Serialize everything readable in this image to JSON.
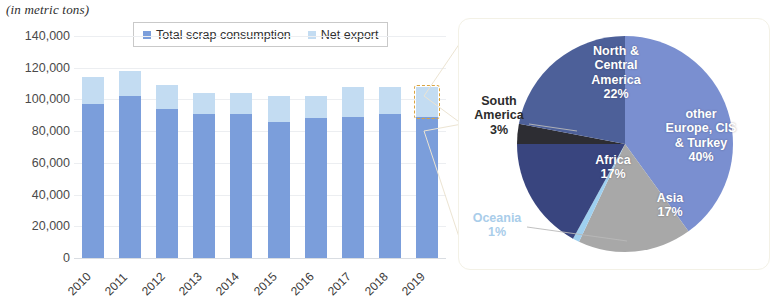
{
  "title_note": "(in metric tons)",
  "legend": {
    "items": [
      {
        "label": "Total scrap consumption",
        "color": "#7b9edb",
        "icon": "legend-square-icon"
      },
      {
        "label": "Net export",
        "color": "#c3dcf2",
        "icon": "legend-square-icon"
      }
    ]
  },
  "chart_data": [
    {
      "type": "bar",
      "title": "",
      "subtitle": "(in metric tons)",
      "xlabel": "",
      "ylabel": "(in metric tons)",
      "ylim": [
        0,
        140000
      ],
      "ytick_labels": [
        "140,000",
        "120,000",
        "100,000",
        "80,000",
        "60,000",
        "40,000",
        "20,000",
        "0"
      ],
      "yticks": [
        140000,
        120000,
        100000,
        80000,
        60000,
        40000,
        20000,
        0
      ],
      "grid": true,
      "stacked": true,
      "legend_position": "top-center",
      "categories": [
        "2010",
        "2011",
        "2012",
        "2013",
        "2014",
        "2015",
        "2016",
        "2017",
        "2018",
        "2019"
      ],
      "series": [
        {
          "name": "Total scrap consumption",
          "color": "#7b9edb",
          "values": [
            97000,
            102000,
            94000,
            91000,
            91000,
            86000,
            88000,
            89000,
            91000,
            89000
          ]
        },
        {
          "name": "Net export",
          "color": "#c3dcf2",
          "values": [
            17000,
            16000,
            15000,
            13000,
            13000,
            16000,
            14000,
            19000,
            17000,
            19000
          ]
        }
      ],
      "totals": [
        114000,
        118000,
        109000,
        104000,
        104000,
        102000,
        102000,
        108000,
        108000,
        108000
      ],
      "highlight": {
        "category": "2019",
        "series": "Net export",
        "style": "dashed-box",
        "color": "#d9a441"
      }
    },
    {
      "type": "pie",
      "title": "",
      "labels": [
        "other Europe, CIS & Turkey",
        "Asia",
        "Oceania",
        "Africa",
        "South America",
        "North & Central America"
      ],
      "values": [
        40,
        17,
        1,
        17,
        3,
        22
      ],
      "value_suffix": "%",
      "colors": [
        "#7a8fd0",
        "#a8a8a8",
        "#9fd0f0",
        "#39457f",
        "#2d2d33",
        "#4d6099"
      ],
      "legend_position": "none",
      "slice_labels": [
        {
          "name": "other Europe, CIS & Turkey",
          "pct": "40%",
          "text": "other\nEurope, CIS\n& Turkey\n40%",
          "placement": "inside"
        },
        {
          "name": "North & Central America",
          "pct": "22%",
          "text": "North &\nCentral\nAmerica\n22%",
          "placement": "inside"
        },
        {
          "name": "Asia",
          "pct": "17%",
          "text": "Asia\n17%",
          "placement": "inside"
        },
        {
          "name": "Africa",
          "pct": "17%",
          "text": "Africa\n17%",
          "placement": "inside"
        },
        {
          "name": "South America",
          "pct": "3%",
          "text": "South\nAmerica\n3%",
          "placement": "outside-left"
        },
        {
          "name": "Oceania",
          "pct": "1%",
          "text": "Oceania\n1%",
          "placement": "outside-left"
        }
      ]
    }
  ],
  "pie_text": {
    "other_europe_l1": "other",
    "other_europe_l2": "Europe, CIS",
    "other_europe_l3": "& Turkey",
    "other_europe_pct": "40%",
    "north_central_l1": "North &",
    "north_central_l2": "Central",
    "north_central_l3": "America",
    "north_central_pct": "22%",
    "asia_l1": "Asia",
    "asia_pct": "17%",
    "africa_l1": "Africa",
    "africa_pct": "17%",
    "south_america_l1": "South",
    "south_america_l2": "America",
    "south_america_pct": "3%",
    "oceania_l1": "Oceania",
    "oceania_pct": "1%"
  },
  "colors": {
    "bar_consumption": "#7b9edb",
    "bar_export": "#c3dcf2",
    "highlight": "#d9a441",
    "gridline": "#eceef1",
    "panel_border": "#f3f1e6",
    "connector": "#efe7d6"
  }
}
